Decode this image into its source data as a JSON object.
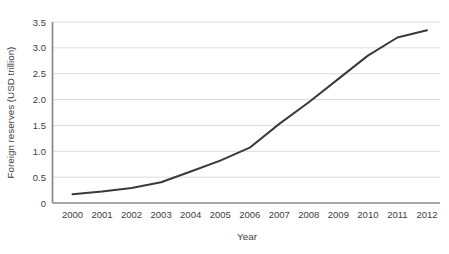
{
  "chart_data": {
    "type": "line",
    "title": "",
    "xlabel": "Year",
    "ylabel": "Foreign reserves (USD trillion)",
    "categories": [
      "2000",
      "2001",
      "2002",
      "2003",
      "2004",
      "2005",
      "2006",
      "2007",
      "2008",
      "2009",
      "2010",
      "2011",
      "2012"
    ],
    "series": [
      {
        "name": "Foreign reserves",
        "values": [
          0.17,
          0.22,
          0.29,
          0.4,
          0.61,
          0.82,
          1.07,
          1.53,
          1.95,
          2.4,
          2.85,
          3.2,
          3.34
        ]
      }
    ],
    "ylim": [
      0,
      3.5
    ],
    "ytick_labels": [
      "0",
      "0.5",
      "1.0",
      "1.5",
      "2.0",
      "2.5",
      "3.0",
      "3.5"
    ],
    "grid": "horizontal",
    "legend": "none",
    "colors": {
      "line": "#3a3a3a",
      "grid": "#dcdcdc",
      "axis": "#8a8a8a",
      "text": "#404040",
      "background": "#ffffff"
    }
  }
}
